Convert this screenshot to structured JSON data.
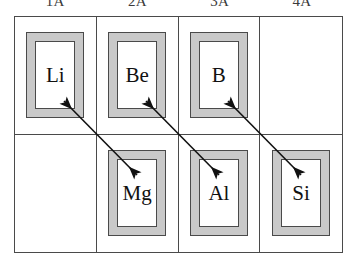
{
  "figure": {
    "name": "diagonal-relationship-diagram",
    "colors": {
      "frame_gray": "#c9c9c9",
      "line_dark": "#4a4a4a",
      "text": "#111111",
      "header_text": "#3a3a3a",
      "background": "#ffffff"
    }
  },
  "headers": [
    {
      "label": "1A"
    },
    {
      "label": "2A"
    },
    {
      "label": "3A"
    },
    {
      "label": "4A"
    }
  ],
  "grid": {
    "rows": [
      {
        "cells": [
          {
            "symbol": "Li",
            "empty": false,
            "group": "1A"
          },
          {
            "symbol": "Be",
            "empty": false,
            "group": "2A"
          },
          {
            "symbol": "B",
            "empty": false,
            "group": "3A"
          },
          {
            "symbol": "",
            "empty": true,
            "group": "4A"
          }
        ]
      },
      {
        "cells": [
          {
            "symbol": "",
            "empty": true,
            "group": "1A"
          },
          {
            "symbol": "Mg",
            "empty": false,
            "group": "2A"
          },
          {
            "symbol": "Al",
            "empty": false,
            "group": "3A"
          },
          {
            "symbol": "Si",
            "empty": false,
            "group": "4A"
          }
        ]
      }
    ]
  },
  "arrows": [
    {
      "name": "arrow-li-mg",
      "from": "Li",
      "to": "Mg",
      "double_headed": true
    },
    {
      "name": "arrow-be-al",
      "from": "Be",
      "to": "Al",
      "double_headed": true
    },
    {
      "name": "arrow-b-si",
      "from": "B",
      "to": "Si",
      "double_headed": true
    }
  ]
}
